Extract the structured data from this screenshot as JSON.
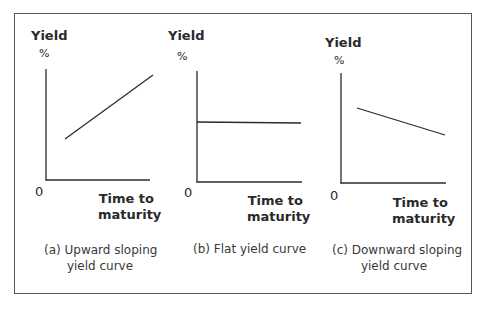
{
  "figure": {
    "panels": [
      {
        "id": "a",
        "y_axis_label": "Yield",
        "y_axis_unit": "%",
        "origin_label": "0",
        "x_axis_label_line1": "Time to",
        "x_axis_label_line2": "maturity",
        "caption_line1": "(a) Upward sloping",
        "caption_line2": "yield curve",
        "curve_shape": "upward"
      },
      {
        "id": "b",
        "y_axis_label": "Yield",
        "y_axis_unit": "%",
        "origin_label": "0",
        "x_axis_label_line1": "Time to",
        "x_axis_label_line2": "maturity",
        "caption_line1": "(b) Flat yield curve",
        "caption_line2": "",
        "curve_shape": "flat"
      },
      {
        "id": "c",
        "y_axis_label": "Yield",
        "y_axis_unit": "%",
        "origin_label": "0",
        "x_axis_label_line1": "Time to",
        "x_axis_label_line2": "maturity",
        "caption_line1": "(c) Downward sloping",
        "caption_line2": "yield curve",
        "curve_shape": "downward"
      }
    ],
    "colors": {
      "line": "#2b2b2b",
      "frame": "#555555",
      "text": "#2a2a2a"
    }
  }
}
